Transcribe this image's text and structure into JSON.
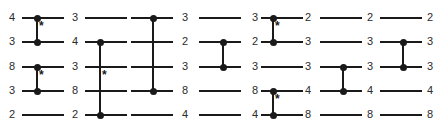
{
  "diagram": {
    "row_count": 5,
    "column_count": 7,
    "row_y": [
      17,
      41,
      66,
      90,
      114
    ],
    "wire_color": "#1a1a1a",
    "label_color": "#2b2b2b",
    "background": "#ffffff",
    "star_glyph": "*",
    "columns": [
      {
        "index": 0,
        "labels": [
          "4",
          "3",
          "8",
          "3",
          "2"
        ],
        "label_x": 6,
        "wire_x": 22,
        "wire_width": 42,
        "comparators": [
          {
            "x": 36,
            "top_row": 0,
            "bottom_row": 1,
            "star": true
          },
          {
            "x": 36,
            "top_row": 2,
            "bottom_row": 3,
            "star": true
          }
        ]
      },
      {
        "index": 1,
        "labels": [
          "3",
          "4",
          "3",
          "8",
          "2"
        ],
        "label_x": 69,
        "wire_x": 85,
        "wire_width": 42,
        "comparators": [
          {
            "x": 99,
            "top_row": 1,
            "bottom_row": 4,
            "star": true
          }
        ]
      },
      {
        "index": 2,
        "labels": [
          "3",
          "2",
          "3",
          "8",
          "4"
        ],
        "label_x": 179,
        "wire_x": 131,
        "wire_width": 42,
        "comparators": [
          {
            "x": 152,
            "top_row": 0,
            "bottom_row": 3,
            "star": false
          }
        ]
      },
      {
        "index": 3,
        "labels": [
          "3",
          "2",
          "3",
          "8",
          "4"
        ],
        "label_x": 249,
        "wire_x": 199,
        "wire_width": 42,
        "comparators": [
          {
            "x": 222,
            "top_row": 1,
            "bottom_row": 2,
            "star": false
          }
        ]
      },
      {
        "index": 4,
        "labels": [
          "2",
          "3",
          "3",
          "4",
          "8"
        ],
        "label_x": 302,
        "wire_x": 261,
        "wire_width": 42,
        "comparators": [
          {
            "x": 272,
            "top_row": 0,
            "bottom_row": 1,
            "star": true
          },
          {
            "x": 272,
            "top_row": 3,
            "bottom_row": 4,
            "star": true
          }
        ]
      },
      {
        "index": 5,
        "labels": [
          "2",
          "3",
          "3",
          "4",
          "8"
        ],
        "label_x": 364,
        "wire_x": 320,
        "wire_width": 42,
        "comparators": [
          {
            "x": 342,
            "top_row": 2,
            "bottom_row": 3,
            "star": false
          }
        ]
      },
      {
        "index": 6,
        "labels": [
          "2",
          "3",
          "3",
          "4",
          "8"
        ],
        "label_x": 424,
        "wire_x": 380,
        "wire_width": 42,
        "comparators": [
          {
            "x": 402,
            "top_row": 1,
            "bottom_row": 2,
            "star": false
          }
        ]
      }
    ]
  }
}
